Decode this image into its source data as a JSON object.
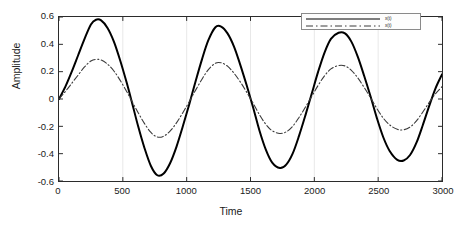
{
  "chart_data": {
    "type": "line",
    "title": "",
    "xlabel": "Time",
    "ylabel": "Amplitude",
    "xlim": [
      0,
      3000
    ],
    "ylim": [
      -0.6,
      0.6
    ],
    "xticks": [
      "0",
      "500",
      "1000",
      "1500",
      "2000",
      "2500",
      "3000"
    ],
    "xtick_values": [
      0,
      500,
      1000,
      1500,
      2000,
      2500,
      3000
    ],
    "yticks": [
      "0.6",
      "0.4",
      "0.2",
      "0",
      "-0.2",
      "-0.4",
      "-0.6"
    ],
    "ytick_values": [
      0.6,
      0.4,
      0.2,
      0,
      -0.2,
      -0.4,
      -0.6
    ],
    "grid": "vertical-major-light",
    "legend_position": "top-right",
    "series": [
      {
        "name": "x(t)",
        "style": "solid",
        "color": "#000000",
        "width": 2.0,
        "amplitude_envelope": [
          0.58,
          0.56,
          0.53,
          0.51,
          0.485,
          0.45
        ],
        "period": 970,
        "points": [
          [
            0,
            0.0
          ],
          [
            50,
            0.09
          ],
          [
            100,
            0.2
          ],
          [
            150,
            0.32
          ],
          [
            200,
            0.44
          ],
          [
            250,
            0.545
          ],
          [
            290,
            0.58
          ],
          [
            330,
            0.575
          ],
          [
            380,
            0.52
          ],
          [
            430,
            0.42
          ],
          [
            480,
            0.28
          ],
          [
            530,
            0.12
          ],
          [
            570,
            -0.02
          ],
          [
            620,
            -0.2
          ],
          [
            670,
            -0.36
          ],
          [
            720,
            -0.49
          ],
          [
            770,
            -0.558
          ],
          [
            820,
            -0.545
          ],
          [
            870,
            -0.47
          ],
          [
            920,
            -0.35
          ],
          [
            970,
            -0.2
          ],
          [
            1020,
            -0.04
          ],
          [
            1070,
            0.13
          ],
          [
            1120,
            0.29
          ],
          [
            1170,
            0.43
          ],
          [
            1225,
            0.525
          ],
          [
            1270,
            0.53
          ],
          [
            1320,
            0.48
          ],
          [
            1370,
            0.385
          ],
          [
            1420,
            0.25
          ],
          [
            1470,
            0.1
          ],
          [
            1520,
            -0.06
          ],
          [
            1570,
            -0.23
          ],
          [
            1620,
            -0.37
          ],
          [
            1670,
            -0.465
          ],
          [
            1730,
            -0.505
          ],
          [
            1780,
            -0.48
          ],
          [
            1830,
            -0.4
          ],
          [
            1880,
            -0.27
          ],
          [
            1930,
            -0.12
          ],
          [
            1980,
            0.04
          ],
          [
            2030,
            0.2
          ],
          [
            2080,
            0.34
          ],
          [
            2130,
            0.44
          ],
          [
            2190,
            0.485
          ],
          [
            2240,
            0.48
          ],
          [
            2290,
            0.42
          ],
          [
            2340,
            0.31
          ],
          [
            2390,
            0.17
          ],
          [
            2440,
            0.02
          ],
          [
            2490,
            -0.14
          ],
          [
            2540,
            -0.28
          ],
          [
            2590,
            -0.38
          ],
          [
            2650,
            -0.445
          ],
          [
            2700,
            -0.45
          ],
          [
            2750,
            -0.41
          ],
          [
            2800,
            -0.32
          ],
          [
            2850,
            -0.19
          ],
          [
            2900,
            -0.05
          ],
          [
            2950,
            0.08
          ],
          [
            3000,
            0.18
          ]
        ]
      },
      {
        "name": "x(t)",
        "style": "dashdot",
        "color": "#3a3a3a",
        "width": 1.1,
        "amplitude_envelope": [
          0.29,
          0.28,
          0.265,
          0.25,
          0.245,
          0.225
        ],
        "period": 970,
        "points": [
          [
            0,
            0.0
          ],
          [
            50,
            0.055
          ],
          [
            100,
            0.115
          ],
          [
            150,
            0.175
          ],
          [
            200,
            0.235
          ],
          [
            250,
            0.278
          ],
          [
            290,
            0.29
          ],
          [
            330,
            0.285
          ],
          [
            380,
            0.255
          ],
          [
            430,
            0.205
          ],
          [
            480,
            0.135
          ],
          [
            530,
            0.055
          ],
          [
            570,
            -0.015
          ],
          [
            620,
            -0.1
          ],
          [
            670,
            -0.18
          ],
          [
            720,
            -0.245
          ],
          [
            770,
            -0.278
          ],
          [
            820,
            -0.272
          ],
          [
            870,
            -0.235
          ],
          [
            920,
            -0.175
          ],
          [
            970,
            -0.1
          ],
          [
            1020,
            -0.02
          ],
          [
            1070,
            0.065
          ],
          [
            1120,
            0.145
          ],
          [
            1170,
            0.215
          ],
          [
            1225,
            0.262
          ],
          [
            1270,
            0.265
          ],
          [
            1320,
            0.24
          ],
          [
            1370,
            0.19
          ],
          [
            1420,
            0.125
          ],
          [
            1470,
            0.05
          ],
          [
            1520,
            -0.03
          ],
          [
            1570,
            -0.115
          ],
          [
            1620,
            -0.185
          ],
          [
            1670,
            -0.232
          ],
          [
            1730,
            -0.252
          ],
          [
            1780,
            -0.24
          ],
          [
            1830,
            -0.2
          ],
          [
            1880,
            -0.135
          ],
          [
            1930,
            -0.06
          ],
          [
            1980,
            0.02
          ],
          [
            2030,
            0.1
          ],
          [
            2080,
            0.17
          ],
          [
            2130,
            0.22
          ],
          [
            2190,
            0.245
          ],
          [
            2240,
            0.242
          ],
          [
            2290,
            0.21
          ],
          [
            2340,
            0.155
          ],
          [
            2390,
            0.085
          ],
          [
            2440,
            0.01
          ],
          [
            2490,
            -0.07
          ],
          [
            2540,
            -0.14
          ],
          [
            2590,
            -0.19
          ],
          [
            2650,
            -0.222
          ],
          [
            2700,
            -0.225
          ],
          [
            2750,
            -0.205
          ],
          [
            2800,
            -0.16
          ],
          [
            2850,
            -0.095
          ],
          [
            2900,
            -0.025
          ],
          [
            2950,
            0.04
          ],
          [
            3000,
            0.09
          ]
        ]
      }
    ]
  },
  "legend": {
    "entries": [
      {
        "label": "x(t)",
        "style": "solid"
      },
      {
        "label": "x(t)",
        "style": "dashdot"
      }
    ]
  },
  "colors": {
    "axis": "#2b2b2b",
    "grid": "#e8e8e8",
    "series_solid": "#000000",
    "series_dashdot": "#3a3a3a",
    "background": "#ffffff"
  }
}
